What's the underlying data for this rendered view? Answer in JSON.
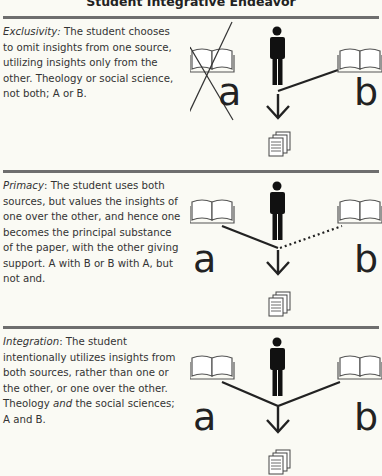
{
  "title": "Student Integrative Endeavor",
  "sections": [
    {
      "term": "Exclusivity:",
      "text": " The student chooses to omit insights from one source, utilizing insights only from the other. Theology or social science, not both; A or B.",
      "diagram": {
        "left_label": "a",
        "right_label": "b",
        "left_crossed": true,
        "left_link": "none",
        "right_link": "solid"
      }
    },
    {
      "term": "Primacy",
      "text": ": The student uses both sources, but values the insights of one over the other, and hence one becomes the principal substance of the paper, with the other giving support. A with B or B with A, but not and.",
      "diagram": {
        "left_label": "a",
        "right_label": "b",
        "left_crossed": false,
        "left_link": "solid",
        "right_link": "dotted"
      }
    },
    {
      "term": "Integration",
      "text_before": ": The student intentionally utilizes insights from both sources, rather than one or the other, or one over the other. Theology ",
      "emph": "and",
      "text_after": " the social sciences; A and B.",
      "diagram": {
        "left_label": "a",
        "right_label": "b",
        "left_crossed": false,
        "left_link": "solid",
        "right_link": "solid"
      }
    }
  ],
  "colors": {
    "ink": "#1e1e1e",
    "divider": "#6e6e6e",
    "background": "#fafaf4",
    "book": "#555555"
  }
}
